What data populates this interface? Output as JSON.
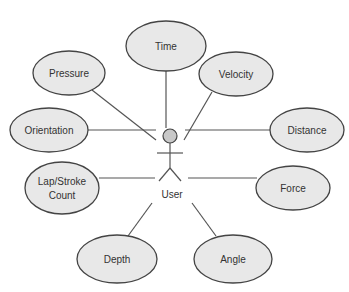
{
  "diagram": {
    "type": "use-case",
    "actor": {
      "label": "User"
    },
    "use_cases": [
      {
        "id": "time",
        "label": "Time"
      },
      {
        "id": "pressure",
        "label": "Pressure"
      },
      {
        "id": "velocity",
        "label": "Velocity"
      },
      {
        "id": "orientation",
        "label": "Orientation"
      },
      {
        "id": "distance",
        "label": "Distance"
      },
      {
        "id": "lap-stroke-count",
        "label_line1": "Lap/Stroke",
        "label_line2": "Count"
      },
      {
        "id": "force",
        "label": "Force"
      },
      {
        "id": "depth",
        "label": "Depth"
      },
      {
        "id": "angle",
        "label": "Angle"
      }
    ],
    "colors": {
      "ellipse_fill": "#e8e8e8",
      "stroke": "#444444",
      "actor_head_fill": "#c8c8c8"
    }
  }
}
